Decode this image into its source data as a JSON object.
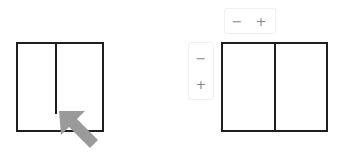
{
  "left_figure": {
    "description": "Rectangle with partial internal divider, arrow pointing at divider end",
    "arrow": {
      "color": "#9a9a9a",
      "direction": "up-left"
    }
  },
  "right_figure": {
    "description": "Rectangle split into two panes by full vertical divider",
    "horizontal_controls": {
      "decrease_label": "−",
      "increase_label": "+"
    },
    "vertical_controls": {
      "decrease_label": "−",
      "increase_label": "+"
    }
  },
  "colors": {
    "stroke": "#1e1e1e",
    "control_text": "#8a8a8a",
    "arrow": "#9a9a9a"
  }
}
